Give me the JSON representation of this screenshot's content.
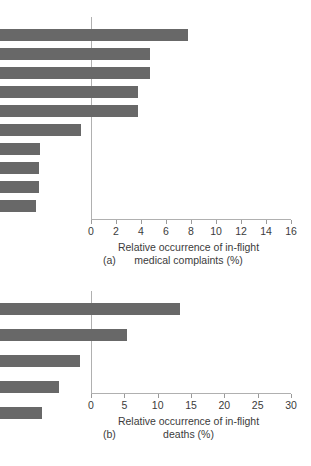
{
  "figure": {
    "background": "#ffffff",
    "bar_color": "#686868",
    "axis_color": "#b0b0b0",
    "text_color": "#3b3b3b"
  },
  "chart_data": [
    {
      "type": "bar",
      "orientation": "horizontal",
      "panel": "(a)",
      "title": "",
      "categories": [
        "Syncope",
        "Trauma",
        "Gastrointestinal",
        "Cardiovascular",
        "Respiratory",
        "Neurological",
        "Weakness",
        "Vertigo",
        "Psychiatric",
        "Allergic"
      ],
      "values": [
        15.0,
        12.0,
        12.0,
        11.0,
        11.0,
        6.5,
        3.2,
        3.1,
        3.1,
        2.9
      ],
      "xlabel": "Relative occurrence of in-flight medical complaints (%)",
      "xlabel_line1": "Relative occurrence of in-flight",
      "xlabel_line2": "medical complaints (%)",
      "ylabel": "",
      "xlim": [
        0,
        16
      ],
      "xticks": [
        0,
        2,
        4,
        6,
        8,
        10,
        12,
        14,
        16
      ],
      "xticklabels": [
        "0",
        "2",
        "4",
        "6",
        "8",
        "10",
        "12",
        "14",
        "16"
      ],
      "grid": false,
      "legend": false
    },
    {
      "type": "bar",
      "orientation": "horizontal",
      "panel": "(b)",
      "title": "",
      "categories": [
        "Syncope",
        "Trauma",
        "Gastrointestinal",
        "Cardiovascular",
        "Respiratory"
      ],
      "values": [
        27.0,
        19.0,
        12.0,
        8.8,
        6.3
      ],
      "xlabel": "Relative occurrence of in-flight deaths (%)",
      "xlabel_line1": "Relative occurrence of in-flight",
      "xlabel_line2": "deaths (%)",
      "ylabel": "",
      "xlim": [
        0,
        30
      ],
      "xticks": [
        0,
        5,
        10,
        15,
        20,
        25,
        30
      ],
      "xticklabels": [
        "0",
        "5",
        "10",
        "15",
        "20",
        "25",
        "30"
      ],
      "grid": false,
      "legend": false
    }
  ]
}
